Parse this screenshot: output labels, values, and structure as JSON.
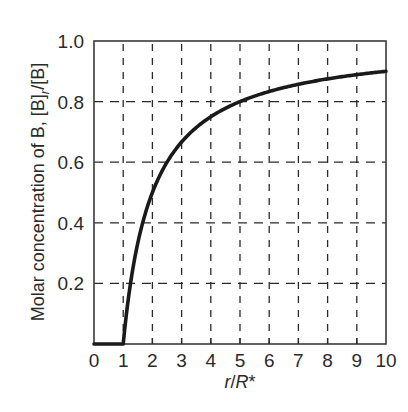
{
  "chart_data": {
    "type": "line",
    "title": "",
    "xlabel": "r/R*",
    "ylabel": "Molar concentration of B, [B]r/[B]",
    "xlim": [
      0,
      10
    ],
    "ylim": [
      0,
      1.0
    ],
    "x_ticks": [
      0,
      1,
      2,
      3,
      4,
      5,
      6,
      7,
      8,
      9,
      10
    ],
    "y_ticks": [
      0.2,
      0.4,
      0.6,
      0.8,
      1.0
    ],
    "x_tick_labels": [
      "0",
      "1",
      "2",
      "3",
      "4",
      "5",
      "6",
      "7",
      "8",
      "9",
      "10"
    ],
    "y_tick_labels": [
      "0.2",
      "0.4",
      "0.6",
      "0.8",
      "1.0"
    ],
    "grid": true,
    "grid_style": "dashed",
    "legend": null,
    "series": [
      {
        "name": "[B]r/[B]",
        "x": [
          0,
          1,
          1.25,
          1.5,
          2,
          2.5,
          3,
          4,
          5,
          6,
          7,
          8,
          9,
          10
        ],
        "values": [
          0,
          0,
          0.2,
          0.33,
          0.5,
          0.6,
          0.67,
          0.75,
          0.8,
          0.83,
          0.86,
          0.88,
          0.89,
          0.9
        ]
      }
    ]
  },
  "labels": {
    "ylabel_main": "Molar concentration of B, [B]",
    "ylabel_sub": "r",
    "ylabel_tail": "/[B]",
    "xlabel_r": "r",
    "xlabel_slash": "/",
    "xlabel_R": "R",
    "xlabel_star": "*"
  },
  "colors": {
    "line": "#1a1a1a",
    "grid": "#2a2a2a",
    "text": "#2a2a2a",
    "frame": "#3a3a3a"
  }
}
